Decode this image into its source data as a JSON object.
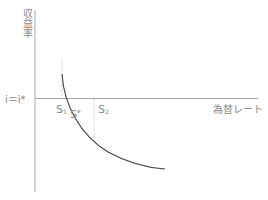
{
  "diagram": {
    "y_axis_label": "収益率",
    "x_axis_label": "為替レート",
    "horizontal_line_label": "i＝i*",
    "points": [
      {
        "label": "S",
        "subscript": "1"
      },
      {
        "label": "S",
        "superscript": "e"
      },
      {
        "label": "S",
        "subscript": "2"
      }
    ],
    "curve": "downward-sloping convex expected-return curve",
    "colors": {
      "axis": "#9a9a9a",
      "curve": "#404040",
      "dotted": "#b8b8b8",
      "text": "#8a8a8a"
    }
  }
}
